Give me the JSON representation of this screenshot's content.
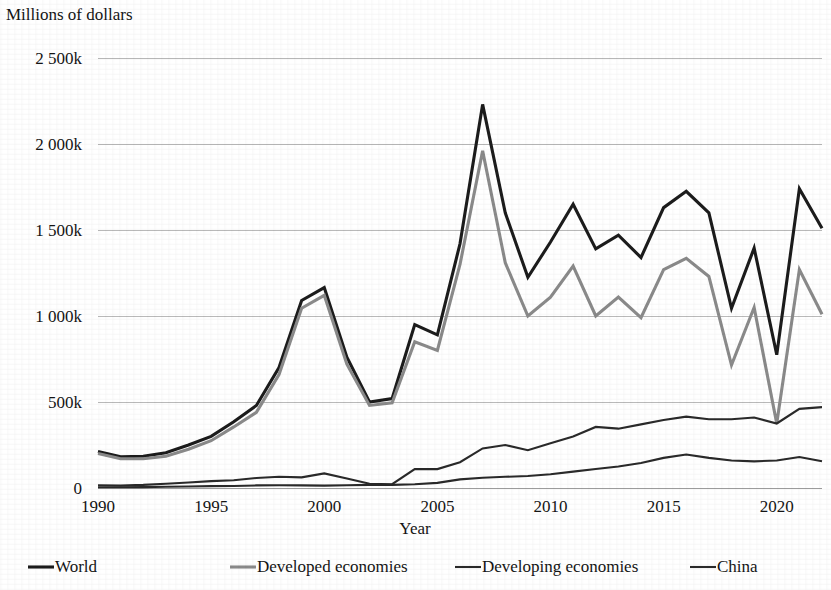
{
  "chart_data": {
    "type": "line",
    "title": "",
    "ylabel": "Millions of dollars",
    "xlabel": "Year",
    "ylim": [
      0,
      2500000
    ],
    "xlim": [
      1990,
      2022
    ],
    "grid": true,
    "legend_position": "bottom",
    "y_tick_labels": [
      "0",
      "500k",
      "1 000k",
      "1 500k",
      "2 000k",
      "2 500k"
    ],
    "y_tick_values": [
      0,
      500000,
      1000000,
      1500000,
      2000000,
      2500000
    ],
    "x_tick_labels": [
      "1990",
      "1995",
      "2000",
      "2005",
      "2010",
      "2015",
      "2020"
    ],
    "x_tick_values": [
      1990,
      1995,
      2000,
      2005,
      2010,
      2015,
      2020
    ],
    "x": [
      1990,
      1991,
      1992,
      1993,
      1994,
      1995,
      1996,
      1997,
      1998,
      1999,
      2000,
      2001,
      2002,
      2003,
      2004,
      2005,
      2006,
      2007,
      2008,
      2009,
      2010,
      2011,
      2012,
      2013,
      2014,
      2015,
      2016,
      2017,
      2018,
      2019,
      2020,
      2021,
      2022
    ],
    "series": [
      {
        "name": "World",
        "color": "#1c1c1c",
        "width": 3.1,
        "values": [
          212000,
          182000,
          185000,
          205000,
          250000,
          300000,
          385000,
          480000,
          700000,
          1090000,
          1165000,
          760000,
          500000,
          520000,
          950000,
          890000,
          1420000,
          2230000,
          1600000,
          1225000,
          1430000,
          1650000,
          1390000,
          1470000,
          1340000,
          1630000,
          1725000,
          1600000,
          1045000,
          1395000,
          775000,
          1740000,
          1510000
        ]
      },
      {
        "name": "Developed economies",
        "color": "#8a8a8a",
        "width": 3.1,
        "values": [
          200000,
          170000,
          170000,
          185000,
          225000,
          275000,
          355000,
          440000,
          660000,
          1045000,
          1120000,
          720000,
          480000,
          495000,
          850000,
          800000,
          1300000,
          1960000,
          1310000,
          1000000,
          1110000,
          1290000,
          1000000,
          1110000,
          990000,
          1270000,
          1335000,
          1230000,
          715000,
          1050000,
          375000,
          1270000,
          1010000
        ]
      },
      {
        "name": "Developing economies",
        "color": "#2a2a2a",
        "width": 2.1,
        "values": [
          16000,
          14000,
          18000,
          25000,
          32000,
          40000,
          45000,
          58000,
          65000,
          62000,
          85000,
          55000,
          25000,
          22000,
          110000,
          110000,
          150000,
          230000,
          250000,
          220000,
          260000,
          300000,
          355000,
          345000,
          370000,
          395000,
          415000,
          400000,
          400000,
          410000,
          375000,
          460000,
          470000
        ]
      },
      {
        "name": "China",
        "color": "#2a2a2a",
        "width": 2.1,
        "values": [
          4000,
          4000,
          5000,
          7000,
          9000,
          11000,
          12000,
          15000,
          16000,
          15000,
          14000,
          16000,
          18000,
          18000,
          22000,
          30000,
          50000,
          60000,
          65000,
          70000,
          80000,
          95000,
          110000,
          125000,
          145000,
          175000,
          195000,
          175000,
          160000,
          155000,
          160000,
          180000,
          155000
        ]
      }
    ]
  },
  "legend": {
    "items": [
      {
        "label": "World"
      },
      {
        "label": "Developed economies"
      },
      {
        "label": "Developing economies"
      },
      {
        "label": "China"
      }
    ]
  }
}
